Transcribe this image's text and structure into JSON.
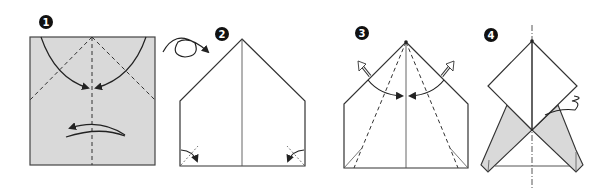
{
  "diagram": {
    "type": "origami-instructions",
    "steps": [
      {
        "number": "1",
        "label": "1",
        "description": "Square paper (colored side up) with valley folds toward center and turn-over arrow"
      },
      {
        "number": "2",
        "label": "2",
        "description": "Flipped over; pentagon shape with corner fold indicators"
      },
      {
        "number": "3",
        "label": "3",
        "description": "Valley folds from apex to base, flaps unfold outward"
      },
      {
        "number": "4",
        "label": "4",
        "description": "Result with diamond top, shaded flaps and pleat fold indicator"
      }
    ],
    "colors": {
      "paper_colored": "#d9d9d9",
      "paper_white": "#ffffff",
      "line": "#333333",
      "badge": "#111111"
    }
  }
}
